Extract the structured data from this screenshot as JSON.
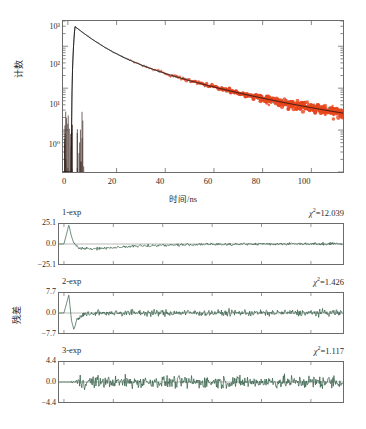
{
  "figure": {
    "colors": {
      "data_red": "#e0401c",
      "fit_black": "#141414",
      "residual_green": "#2f5b44",
      "frame": "#6b6b6b",
      "background": "#ffffff"
    }
  },
  "chart_data": [
    {
      "type": "line",
      "name": "fluorescence-decay",
      "title": "",
      "xlabel": "时间/ns",
      "ylabel": "计数",
      "yscale": "log",
      "xlim": [
        -2,
        113
      ],
      "ylim": [
        1,
        4000
      ],
      "xticks": [
        0,
        20,
        40,
        60,
        80,
        100
      ],
      "xticklabels": [
        "0",
        "20",
        "40",
        "60",
        "80",
        "100"
      ],
      "yticks": [
        1,
        10,
        100,
        1000
      ],
      "yticklabels": [
        "10⁰",
        "10¹",
        "10²",
        "10³"
      ],
      "grid": false,
      "legend": "none",
      "series": [
        {
          "name": "decay-data",
          "color": "#e0401c",
          "style": "noisy-markers",
          "comment": "red measured decay points, visible above ~55 ns",
          "x": [
            0,
            1.5,
            2.0,
            2.6,
            3.2,
            4,
            6,
            8,
            10,
            14,
            18,
            22,
            26,
            30,
            34,
            38,
            42,
            46,
            50,
            54,
            58,
            62,
            66,
            70,
            74,
            78,
            82,
            86,
            90,
            94,
            98,
            102,
            106,
            110,
            112
          ],
          "y": [
            1,
            2,
            900,
            3000,
            2600,
            1900,
            1100,
            760,
            560,
            330,
            220,
            160,
            118,
            90,
            70,
            56,
            45,
            37,
            30,
            25,
            21,
            17,
            14.5,
            12,
            10.2,
            8.6,
            7.3,
            6.2,
            5.3,
            4.6,
            4.0,
            3.5,
            3.1,
            2.8,
            2.7
          ]
        },
        {
          "name": "fit-curve",
          "color": "#141414",
          "style": "line",
          "comment": "black multi-exponential fit overlaid on data"
        },
        {
          "name": "instrument-response",
          "color": "#141414",
          "style": "spike",
          "comment": "sharp IRF spike near t = 2-3 ns plus baseline noise near counts = 1"
        }
      ]
    },
    {
      "type": "line",
      "name": "residuals-1-exp",
      "title": "1-exp",
      "chi_squared_label": "χ²=12.039",
      "chi_squared": 12.039,
      "ylabel": "",
      "xlim": [
        -2,
        113
      ],
      "ylim": [
        -25.1,
        25.1
      ],
      "yticks": [
        25.1,
        0.0,
        -25.1
      ],
      "yticklabels": [
        "25.1",
        "0.0",
        "−25.1"
      ],
      "grid": false,
      "color": "#2f5b44",
      "comment": "large systematic deviation: sharp positive spike near t=2 ns then a broad negative dip out to ~35 ns, settling near zero",
      "x": [
        0,
        2,
        3,
        4,
        6,
        8,
        10,
        13,
        16,
        20,
        25,
        30,
        35,
        40,
        50,
        60,
        70,
        80,
        90,
        100,
        110
      ],
      "y": [
        0,
        24,
        10,
        1,
        -4.5,
        -6.0,
        -6.2,
        -5.8,
        -5.2,
        -4.4,
        -3.4,
        -2.6,
        -2.0,
        -1.5,
        -0.9,
        -0.5,
        -0.2,
        0.0,
        0.2,
        0.3,
        0.3
      ],
      "noise_amplitude": 1.6
    },
    {
      "type": "line",
      "name": "residuals-2-exp",
      "title": "2-exp",
      "chi_squared_label": "χ²=1.426",
      "chi_squared": 1.426,
      "ylabel": "残差",
      "xlim": [
        -2,
        113
      ],
      "ylim": [
        -7.7,
        7.7
      ],
      "yticks": [
        7.7,
        0.0,
        -7.7
      ],
      "yticklabels": [
        "7.7",
        "0.0",
        "−7.7"
      ],
      "grid": false,
      "color": "#2f5b44",
      "comment": "near-random scatter with a residual oscillation spike at early times (t < 5 ns)",
      "x": [
        0,
        2,
        3,
        4,
        5,
        7,
        10,
        15,
        20,
        30,
        40,
        50,
        60,
        70,
        80,
        90,
        100,
        110
      ],
      "y": [
        0,
        7.0,
        -2.5,
        -6.5,
        -3.0,
        -1.0,
        -0.3,
        0.0,
        0.1,
        0.1,
        0.0,
        0.1,
        0.0,
        0.1,
        0.0,
        0.1,
        0.0,
        0.1
      ],
      "noise_amplitude": 1.2
    },
    {
      "type": "line",
      "name": "residuals-3-exp",
      "title": "3-exp",
      "chi_squared_label": "χ²=1.117",
      "chi_squared": 1.117,
      "ylabel": "",
      "xlim": [
        -2,
        113
      ],
      "ylim": [
        -4.4,
        4.4
      ],
      "yticks": [
        4.4,
        0.0,
        -4.4
      ],
      "yticklabels": [
        "4.4",
        "0.0",
        "−4.4"
      ],
      "grid": false,
      "color": "#2f5b44",
      "comment": "flat randomly distributed residuals about zero across the whole range",
      "x": [
        0,
        10,
        20,
        30,
        40,
        50,
        60,
        70,
        80,
        90,
        100,
        110
      ],
      "y": [
        0,
        0,
        0,
        0,
        0,
        0,
        0,
        0,
        0,
        0,
        0,
        0
      ],
      "noise_amplitude": 1.3
    }
  ],
  "main_plot": {
    "ylabel": "计数",
    "xlabel": "时间/ns",
    "yticklabels": [
      "10³",
      "10²",
      "10¹",
      "10⁰"
    ],
    "xticklabels": [
      "0",
      "20",
      "40",
      "60",
      "80",
      "100"
    ]
  },
  "residual_panels": [
    {
      "title": "1-exp",
      "chi": "χ",
      "chi_sup": "2",
      "chi_value": "=12.039",
      "ytop": "25.1",
      "ymid": "0.0",
      "ybot": "−25.1",
      "ylabel": ""
    },
    {
      "title": "2-exp",
      "chi": "χ",
      "chi_sup": "2",
      "chi_value": "=1.426",
      "ytop": "7.7",
      "ymid": "0.0",
      "ybot": "−7.7",
      "ylabel": "残差"
    },
    {
      "title": "3-exp",
      "chi": "χ",
      "chi_sup": "2",
      "chi_value": "=1.117",
      "ytop": "4.4",
      "ymid": "0.0",
      "ybot": "−4.4",
      "ylabel": ""
    }
  ]
}
